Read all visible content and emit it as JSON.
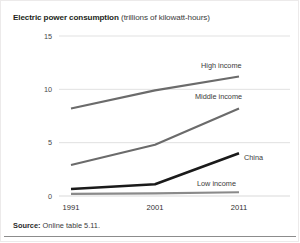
{
  "title": {
    "main": "Electric power consumption",
    "units": "(trillions of kilowatt-hours)"
  },
  "source": {
    "label": "Source:",
    "text": "Online table 5.11."
  },
  "chart_data": {
    "type": "line",
    "title": "Electric power consumption (trillions of kilowatt-hours)",
    "xlabel": "",
    "ylabel": "trillions of kilowatt-hours",
    "x": [
      "1991",
      "2001",
      "2011"
    ],
    "categories": [
      "1991",
      "2001",
      "2011"
    ],
    "yticks": [
      "0",
      "5",
      "10",
      "15"
    ],
    "ylim": [
      0,
      15
    ],
    "grid": "horizontal",
    "legend": "inline-right-of-line",
    "series": [
      {
        "name": "High income",
        "values": [
          8.2,
          9.9,
          11.2
        ],
        "color": "#6b6b6b",
        "width": 2.1
      },
      {
        "name": "Middle income",
        "values": [
          2.9,
          4.8,
          8.2
        ],
        "color": "#6b6b6b",
        "width": 2.1
      },
      {
        "name": "China",
        "values": [
          0.65,
          1.1,
          4.0
        ],
        "color": "#1a1a1a",
        "width": 2.6
      },
      {
        "name": "Low income",
        "values": [
          0.2,
          0.25,
          0.35
        ],
        "color": "#8a8a8a",
        "width": 2.1
      }
    ]
  }
}
